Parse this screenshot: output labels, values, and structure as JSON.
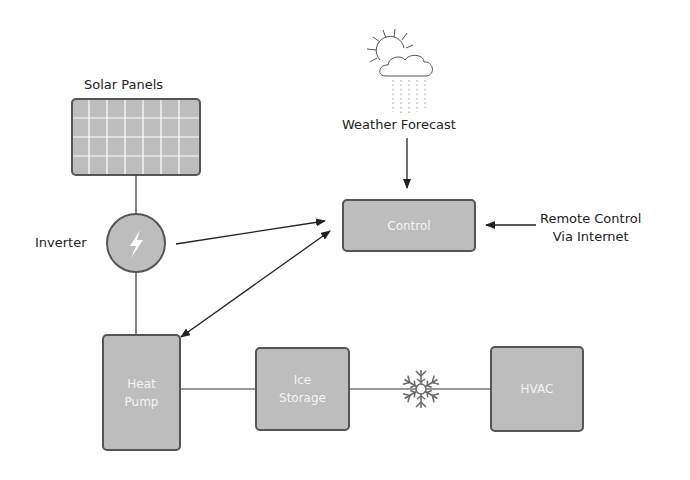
{
  "labels": {
    "solar_panels": "Solar Panels",
    "weather_forecast": "Weather Forecast",
    "inverter": "Inverter",
    "remote_line1": "Remote Control",
    "remote_line2": "Via Internet"
  },
  "nodes": {
    "control": "Control",
    "heat_pump_line1": "Heat",
    "heat_pump_line2": "Pump",
    "ice_storage_line1": "Ice",
    "ice_storage_line2": "Storage",
    "hvac": "HVAC"
  },
  "icons": {
    "weather": "sun-cloud-rain-icon",
    "inverter": "lightning-bolt-icon",
    "cold": "snowflake-icon"
  },
  "colors": {
    "node_fill": "#bdbdbd",
    "node_border": "#555555",
    "line": "#333333"
  }
}
